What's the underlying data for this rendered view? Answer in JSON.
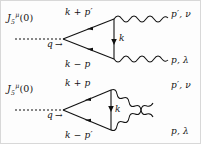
{
  "figure": {
    "type": "feynman-diagrams",
    "background_color": "#fdfdfd",
    "line_color": "#111111",
    "diagram_count": 2
  },
  "diagram_top": {
    "name": "direct-triangle-diagram",
    "operator_label": {
      "base": "J",
      "superscript": "μ",
      "subscript": "5",
      "argument": "(0)"
    },
    "incoming": {
      "momentum": "q",
      "arrow": "→",
      "line_style": "dashed"
    },
    "internal_lines": [
      {
        "name": "upper-fermion",
        "label": "k + p′"
      },
      {
        "name": "lower-fermion",
        "label": "k − p"
      },
      {
        "name": "vertical-fermion",
        "label": "k"
      }
    ],
    "outgoing": [
      {
        "name": "photon-upper",
        "momentum": "p′",
        "index": "ν",
        "label": "p′, ν"
      },
      {
        "name": "photon-lower",
        "momentum": "p",
        "index": "λ",
        "label": "p, λ"
      }
    ],
    "photon_crossed": false
  },
  "diagram_bottom": {
    "name": "crossed-triangle-diagram",
    "operator_label": {
      "base": "J",
      "superscript": "μ",
      "subscript": "5",
      "argument": "(0)"
    },
    "incoming": {
      "momentum": "q",
      "arrow": "→",
      "line_style": "dashed"
    },
    "internal_lines": [
      {
        "name": "upper-fermion",
        "label": "k + p"
      },
      {
        "name": "lower-fermion",
        "label": "k − p′"
      },
      {
        "name": "vertical-fermion",
        "label": "k"
      }
    ],
    "outgoing": [
      {
        "name": "photon-upper",
        "momentum": "p′",
        "index": "ν",
        "label": "p′, ν"
      },
      {
        "name": "photon-lower",
        "momentum": "p",
        "index": "λ",
        "label": "p, λ"
      }
    ],
    "photon_crossed": true
  }
}
